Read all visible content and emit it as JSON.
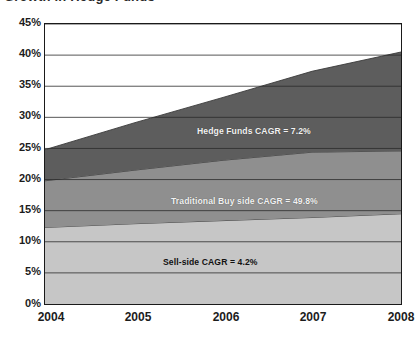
{
  "figure": {
    "partial_title": "Growth in Hedge Funds"
  },
  "chart_data": {
    "type": "area",
    "stacked": true,
    "title": "",
    "subtitle": "",
    "xlabel": "",
    "ylabel": "",
    "x": [
      "2004",
      "2005",
      "2006",
      "2007",
      "2008"
    ],
    "xtick_labels": [
      "2004",
      "2005",
      "2006",
      "2007",
      "2008"
    ],
    "ytick_labels": [
      "0%",
      "5%",
      "10%",
      "15%",
      "20%",
      "25%",
      "30%",
      "35%",
      "40%",
      "45%"
    ],
    "ytick_values": [
      0,
      5,
      10,
      15,
      20,
      25,
      30,
      35,
      40,
      45
    ],
    "ylim": [
      0,
      45
    ],
    "grid": "horizontal",
    "legend": "none",
    "series": [
      {
        "name": "Sell-side",
        "color": "#c6c6c6",
        "values": [
          12.3,
          12.9,
          13.4,
          13.9,
          14.5
        ],
        "cagr_label": "Sell-side CAGR = 4.2%"
      },
      {
        "name": "Traditional Buy side",
        "color": "#8f8f8f",
        "values": [
          7.5,
          8.6,
          9.7,
          10.5,
          10.1
        ],
        "cumulative_top": [
          19.8,
          21.5,
          23.1,
          24.4,
          24.6
        ],
        "cagr_label": "Traditional Buy side CAGR = 49.8%"
      },
      {
        "name": "Hedge Funds",
        "color": "#5d5d5d",
        "values": [
          5.0,
          7.6,
          10.1,
          13.0,
          15.9
        ],
        "cumulative_top": [
          24.8,
          29.1,
          33.2,
          37.4,
          40.5
        ],
        "cagr_label": "Hedge Funds CAGR = 7.2%"
      }
    ],
    "annotations": [
      {
        "text": "Hedge Funds CAGR = 7.2%",
        "series": "Hedge Funds"
      },
      {
        "text": "Traditional Buy side CAGR = 49.8%",
        "series": "Traditional Buy side"
      },
      {
        "text": "Sell-side CAGR = 4.2%",
        "series": "Sell-side"
      }
    ],
    "colors": {
      "hedge_funds": "#5d5d5d",
      "traditional_buy_side": "#8f8f8f",
      "sell_side": "#c6c6c6",
      "axis": "#1a1a1a",
      "gridline": "#2b2b2b",
      "background": "#ffffff"
    }
  }
}
